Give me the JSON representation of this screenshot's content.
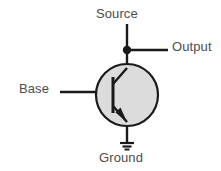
{
  "diagram": {
    "type": "circuit-schematic",
    "component": "bipolar-junction-transistor",
    "labels": {
      "source": "Source",
      "output": "Output",
      "base": "Base",
      "ground": "Ground"
    },
    "colors": {
      "background": "#ffffff",
      "wire": "#1a1a1a",
      "body_fill": "#dcdcdc",
      "body_stroke": "#1a1a1a",
      "text": "#4d4d4d"
    },
    "nodes": [
      {
        "name": "source-terminal",
        "label": "Source",
        "position": "top"
      },
      {
        "name": "output-terminal",
        "label": "Output",
        "position": "right"
      },
      {
        "name": "base-terminal",
        "label": "Base",
        "position": "left"
      },
      {
        "name": "ground-terminal",
        "label": "Ground",
        "position": "bottom"
      }
    ],
    "junction_dot": {
      "x": 127,
      "y": 50,
      "radius": 4
    },
    "body_circle": {
      "cx": 127,
      "cy": 95,
      "r": 31
    },
    "ground_symbol": {
      "bars": 3,
      "widths": [
        14,
        9,
        5
      ]
    }
  }
}
